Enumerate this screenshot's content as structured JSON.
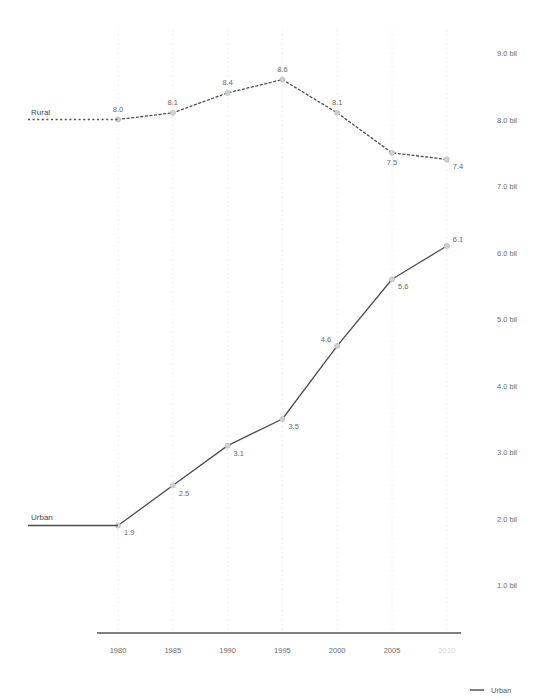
{
  "chart_data": {
    "type": "line",
    "title": "",
    "subtitle": "",
    "xlabel": "",
    "ylabel": "",
    "x": [
      "1980",
      "1985",
      "1990",
      "1995",
      "2000",
      "2005",
      "2010"
    ],
    "xtick_labels": [
      "1980",
      "1985",
      "1990",
      "1995",
      "2000",
      "2005",
      "2010"
    ],
    "xtick_faded": [
      false,
      false,
      false,
      false,
      false,
      false,
      true
    ],
    "ytick_labels": [
      "1.0 bil",
      "2.0 bil",
      "3.0 bil",
      "4.0 bil",
      "5.0 bil",
      "6.0 bil",
      "7.0 bil",
      "8.0 bil",
      "9.0 bil"
    ],
    "ytick_values": [
      1.0,
      2.0,
      3.0,
      4.0,
      5.0,
      6.0,
      7.0,
      8.0,
      9.0
    ],
    "ylim": [
      0.45,
      9.45
    ],
    "grid": "vertical-dotted",
    "legend_position": "bottom-right",
    "series": [
      {
        "name": "Rural",
        "style": "dashed",
        "color": "#4c4c4c",
        "values": [
          8.0,
          8.1,
          8.4,
          8.6,
          8.1,
          7.5,
          7.4
        ],
        "value_labels": [
          "8.0",
          "8.1",
          "8.4",
          "8.6",
          "8.1",
          "7.5",
          "7.4"
        ],
        "label_positions": [
          "above",
          "above",
          "above",
          "above",
          "above",
          "below",
          "below-right"
        ]
      },
      {
        "name": "Urban",
        "style": "solid",
        "color": "#4c4c4c",
        "values": [
          1.9,
          2.5,
          3.1,
          3.5,
          4.6,
          5.6,
          6.1
        ],
        "value_labels": [
          "1.9",
          "2.5",
          "3.1",
          "3.5",
          "4.6",
          "5.6",
          "6.1"
        ],
        "label_positions": [
          "below-right",
          "below-right",
          "below-right",
          "below-right",
          "above-left",
          "below-right",
          "above-right"
        ]
      }
    ],
    "inline_series_labels": [
      {
        "name": "Rural",
        "style": "dashed"
      },
      {
        "name": "Urban",
        "style": "solid"
      }
    ],
    "legend": [
      {
        "label": "Urban",
        "style": "solid",
        "color": "#4c4c4c"
      }
    ],
    "colors": {
      "line": "#4c4c4c",
      "marker_fill": "#d0d0d0",
      "gridline": "#e8ecf2",
      "axis": "#555555",
      "tick_text": "#6d6d6d",
      "faded_tick_text": "#d8d8d8"
    }
  }
}
